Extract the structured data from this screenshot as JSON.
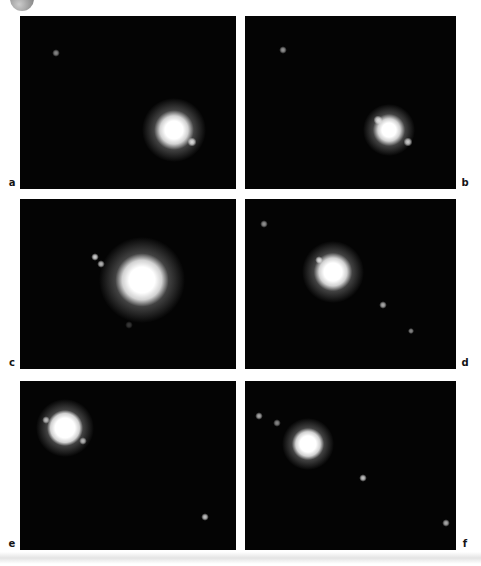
{
  "page": {
    "background_color": "#ffffff"
  },
  "badge": {
    "inner_color": "#cccccc",
    "outer_color": "#8c8c8c",
    "rim_color": "#777777"
  },
  "figure": {
    "panel_bg": "#040404",
    "label_color": "#141414",
    "panels": [
      {
        "label": "a",
        "grid": {
          "row": 0,
          "col": 0
        },
        "label_side": "left",
        "main_spot": {
          "x": 154,
          "y": 114,
          "core_r": 9,
          "halo_r": 19
        },
        "dots": [
          {
            "x": 36,
            "y": 37,
            "r": 1.6,
            "brightness": 0.55
          },
          {
            "x": 172,
            "y": 126,
            "r": 2.1,
            "brightness": 0.85
          }
        ]
      },
      {
        "label": "b",
        "grid": {
          "row": 0,
          "col": 1
        },
        "label_side": "right",
        "main_spot": {
          "x": 144,
          "y": 114,
          "core_r": 7,
          "halo_r": 15
        },
        "dots": [
          {
            "x": 38,
            "y": 34,
            "r": 1.5,
            "brightness": 0.6
          },
          {
            "x": 133,
            "y": 104,
            "r": 1.9,
            "brightness": 0.8
          },
          {
            "x": 163,
            "y": 126,
            "r": 2.0,
            "brightness": 0.8
          }
        ]
      },
      {
        "label": "c",
        "grid": {
          "row": 1,
          "col": 0
        },
        "label_side": "left",
        "main_spot": {
          "x": 122,
          "y": 81,
          "core_r": 13,
          "halo_r": 25
        },
        "dots": [
          {
            "x": 75,
            "y": 58,
            "r": 1.8,
            "brightness": 0.85
          },
          {
            "x": 81,
            "y": 65,
            "r": 1.7,
            "brightness": 0.75
          },
          {
            "x": 109,
            "y": 126,
            "r": 1.5,
            "brightness": 0.22
          }
        ]
      },
      {
        "label": "d",
        "grid": {
          "row": 1,
          "col": 1
        },
        "label_side": "right",
        "main_spot": {
          "x": 88,
          "y": 73,
          "core_r": 9,
          "halo_r": 18
        },
        "dots": [
          {
            "x": 19,
            "y": 25,
            "r": 1.5,
            "brightness": 0.6
          },
          {
            "x": 74,
            "y": 61,
            "r": 1.8,
            "brightness": 0.8
          },
          {
            "x": 138,
            "y": 106,
            "r": 1.6,
            "brightness": 0.7
          },
          {
            "x": 166,
            "y": 132,
            "r": 1.4,
            "brightness": 0.55
          }
        ]
      },
      {
        "label": "e",
        "grid": {
          "row": 2,
          "col": 0
        },
        "label_side": "left",
        "main_spot": {
          "x": 45,
          "y": 47,
          "core_r": 10,
          "halo_r": 17
        },
        "dots": [
          {
            "x": 26,
            "y": 39,
            "r": 1.6,
            "brightness": 0.7
          },
          {
            "x": 63,
            "y": 60,
            "r": 1.8,
            "brightness": 0.7
          },
          {
            "x": 185,
            "y": 136,
            "r": 1.8,
            "brightness": 0.8
          }
        ]
      },
      {
        "label": "f",
        "grid": {
          "row": 2,
          "col": 1
        },
        "label_side": "right",
        "main_spot": {
          "x": 63,
          "y": 63,
          "core_r": 8,
          "halo_r": 15
        },
        "dots": [
          {
            "x": 14,
            "y": 35,
            "r": 1.6,
            "brightness": 0.7
          },
          {
            "x": 32,
            "y": 42,
            "r": 1.5,
            "brightness": 0.55
          },
          {
            "x": 118,
            "y": 97,
            "r": 1.8,
            "brightness": 0.8
          },
          {
            "x": 201,
            "y": 142,
            "r": 1.6,
            "brightness": 0.7
          }
        ]
      }
    ]
  }
}
